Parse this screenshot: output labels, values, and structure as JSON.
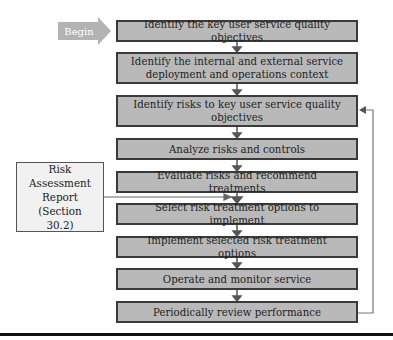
{
  "diagram": {
    "start": {
      "label": "Begin"
    },
    "steps": [
      {
        "label": "Identify the key user service quality objectives"
      },
      {
        "label": "Identify the internal and external service deployment and operations context"
      },
      {
        "label": "Identify risks to key user service quality objectives"
      },
      {
        "label": "Analyze risks and controls"
      },
      {
        "label": "Evaluate risks and recommend treatments"
      },
      {
        "label": "Select risk treatment options to implement"
      },
      {
        "label": "Implement selected risk treatment options"
      },
      {
        "label": "Operate and monitor service"
      },
      {
        "label": "Periodically review performance"
      }
    ],
    "side_input": {
      "label": "Risk Assessment Report (Section 30.2)"
    },
    "feedback": {
      "from": "Periodically review performance",
      "to": "Identify risks to key user service quality objectives"
    },
    "colors": {
      "box_fill": "#b9b9b9",
      "box_border": "#3a3a3a",
      "arrow": "#555555",
      "begin_fill": "#b3b3b3",
      "report_fill": "#f1f1f1"
    }
  }
}
